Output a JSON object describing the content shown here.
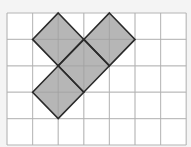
{
  "diagram": {
    "grid": {
      "cols": 7,
      "rows": 5,
      "x0": 7,
      "y0": 13,
      "cell_w": 25.6,
      "cell_h": 26.4,
      "line_color": "#cfcfcf",
      "background": "#ffffff"
    },
    "shapes": [
      {
        "type": "diamond",
        "center_col": 2,
        "center_row": 1
      },
      {
        "type": "diamond",
        "center_col": 4,
        "center_row": 1
      },
      {
        "type": "diamond",
        "center_col": 3,
        "center_row": 2
      },
      {
        "type": "diamond",
        "center_col": 2,
        "center_row": 3
      }
    ],
    "fill_color": "#a9a9a9",
    "stroke_color": "#2a2a2a"
  }
}
